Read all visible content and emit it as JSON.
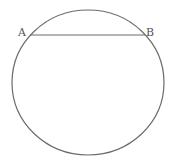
{
  "diagram": {
    "type": "circle-with-chord",
    "points": [
      {
        "id": "A",
        "label": "A"
      },
      {
        "id": "B",
        "label": "B"
      }
    ],
    "chord": {
      "from": "A",
      "to": "B"
    },
    "colors": {
      "stroke": "#6b6b6b",
      "label": "#555555",
      "background": "#ffffff"
    }
  }
}
